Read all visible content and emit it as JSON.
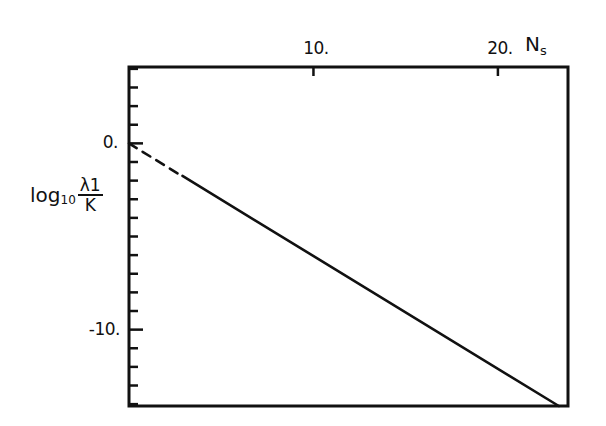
{
  "chart_data": {
    "type": "line",
    "title": "",
    "xlabel": "N_s",
    "ylabel": "log10 (λ1 / K)",
    "xlim": [
      0,
      23.8
    ],
    "ylim": [
      -14.1,
      4.1
    ],
    "x_ticks": [
      10,
      20
    ],
    "x_tick_labels": [
      "10.",
      "20."
    ],
    "y_ticks": [
      0,
      -10
    ],
    "y_tick_labels": [
      "0.",
      "-10."
    ],
    "y_minor_tick_step": 1,
    "x_axis_position": "top",
    "grid": false,
    "legend": null,
    "series": [
      {
        "name": "extrapolated (dashed)",
        "style": "dashed",
        "x": [
          0,
          2.7
        ],
        "y": [
          0,
          -1.65
        ]
      },
      {
        "name": "log10(λ1/K) vs N_s",
        "style": "solid",
        "x": [
          2.9,
          23.3
        ],
        "y": [
          -1.75,
          -14.1
        ]
      }
    ]
  },
  "labels": {
    "x_tick_10": "10.",
    "x_tick_20": "20.",
    "x_title_main": "N",
    "x_title_sub": "s",
    "y_tick_0": "0.",
    "y_tick_neg10": "-10.",
    "y_title_log": "log",
    "y_title_base": "10",
    "y_title_num": "λ1",
    "y_title_den": "K"
  },
  "colors": {
    "ink": "#111111",
    "background": "#ffffff"
  }
}
